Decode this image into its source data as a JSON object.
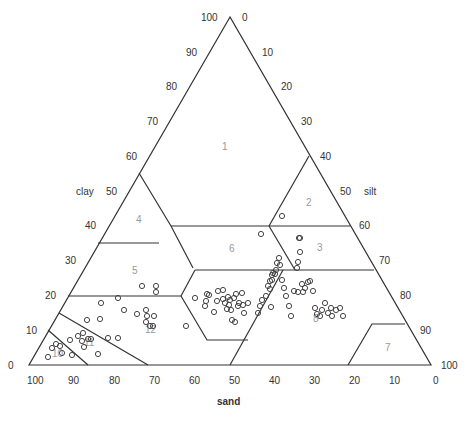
{
  "chart_data": {
    "type": "ternary",
    "title": "",
    "axes": {
      "clay": {
        "label": "clay",
        "ticks": [
          "0",
          "10",
          "20",
          "30",
          "40",
          "50",
          "60",
          "70",
          "80",
          "90",
          "100"
        ]
      },
      "silt": {
        "label": "silt",
        "ticks": [
          "0",
          "10",
          "20",
          "30",
          "40",
          "50",
          "60",
          "70",
          "80",
          "90",
          "100"
        ]
      },
      "sand": {
        "label": "sand",
        "ticks": [
          "100",
          "90",
          "80",
          "70",
          "60",
          "50",
          "40",
          "30",
          "20",
          "10",
          "0"
        ]
      }
    },
    "regions": [
      {
        "id": "1",
        "label": "1"
      },
      {
        "id": "2",
        "label": "2"
      },
      {
        "id": "3",
        "label": "3"
      },
      {
        "id": "4",
        "label": "4"
      },
      {
        "id": "5",
        "label": "5"
      },
      {
        "id": "6",
        "label": "6"
      },
      {
        "id": "7",
        "label": "7"
      },
      {
        "id": "8",
        "label": "8"
      },
      {
        "id": "10",
        "label": "10"
      },
      {
        "id": "11",
        "label": "11"
      },
      {
        "id": "12",
        "label": "12"
      }
    ],
    "points_px": [
      [
        48,
        357
      ],
      [
        52,
        348
      ],
      [
        56,
        344
      ],
      [
        60,
        346
      ],
      [
        62,
        353
      ],
      [
        70,
        340
      ],
      [
        72,
        355
      ],
      [
        78,
        336
      ],
      [
        82,
        341
      ],
      [
        84,
        347
      ],
      [
        83,
        333
      ],
      [
        88,
        339
      ],
      [
        91,
        339
      ],
      [
        98,
        354
      ],
      [
        87,
        320
      ],
      [
        100,
        319
      ],
      [
        108,
        338
      ],
      [
        118,
        338
      ],
      [
        101,
        303
      ],
      [
        118,
        298
      ],
      [
        124,
        310
      ],
      [
        137,
        314
      ],
      [
        146,
        310
      ],
      [
        147,
        316
      ],
      [
        146,
        322
      ],
      [
        150,
        326
      ],
      [
        153,
        326
      ],
      [
        154,
        316
      ],
      [
        142,
        286
      ],
      [
        156,
        286
      ],
      [
        156,
        292
      ],
      [
        186,
        326
      ],
      [
        195,
        298
      ],
      [
        206,
        301
      ],
      [
        209,
        295
      ],
      [
        214,
        312
      ],
      [
        217,
        301
      ],
      [
        218,
        291
      ],
      [
        223,
        290
      ],
      [
        223,
        299
      ],
      [
        225,
        303
      ],
      [
        227,
        309
      ],
      [
        228,
        297
      ],
      [
        229,
        305
      ],
      [
        230,
        300
      ],
      [
        231,
        310
      ],
      [
        234,
        298
      ],
      [
        236,
        294
      ],
      [
        239,
        303
      ],
      [
        243,
        305
      ],
      [
        238,
        306
      ],
      [
        232,
        320
      ],
      [
        235,
        322
      ],
      [
        242,
        293
      ],
      [
        244,
        313
      ],
      [
        248,
        303
      ],
      [
        258,
        313
      ],
      [
        260,
        306
      ],
      [
        262,
        300
      ],
      [
        266,
        296
      ],
      [
        268,
        286
      ],
      [
        270,
        281
      ],
      [
        271,
        307
      ],
      [
        270,
        289
      ],
      [
        272,
        280
      ],
      [
        272,
        275
      ],
      [
        273,
        273
      ],
      [
        275,
        274
      ],
      [
        276,
        270
      ],
      [
        277,
        263
      ],
      [
        279,
        258
      ],
      [
        280,
        265
      ],
      [
        282,
        280
      ],
      [
        284,
        288
      ],
      [
        286,
        296
      ],
      [
        289,
        306
      ],
      [
        291,
        316
      ],
      [
        294,
        291
      ],
      [
        297,
        268
      ],
      [
        298,
        262
      ],
      [
        298,
        292
      ],
      [
        300,
        252
      ],
      [
        299,
        238
      ],
      [
        302,
        284
      ],
      [
        303,
        292
      ],
      [
        305,
        288
      ],
      [
        308,
        282
      ],
      [
        310,
        281
      ],
      [
        313,
        291
      ],
      [
        315,
        308
      ],
      [
        317,
        314
      ],
      [
        320,
        316
      ],
      [
        322,
        310
      ],
      [
        325,
        303
      ],
      [
        328,
        313
      ],
      [
        331,
        308
      ],
      [
        332,
        316
      ],
      [
        336,
        310
      ],
      [
        340,
        308
      ],
      [
        343,
        316
      ],
      [
        261,
        234
      ],
      [
        282,
        216
      ],
      [
        300,
        238
      ],
      [
        205,
        306
      ],
      [
        207,
        294
      ]
    ]
  },
  "labels": {
    "top_left_tick": "100",
    "top_right_tick": "0",
    "clay_axis": "clay",
    "silt_axis": "silt",
    "sand_axis": "sand"
  }
}
